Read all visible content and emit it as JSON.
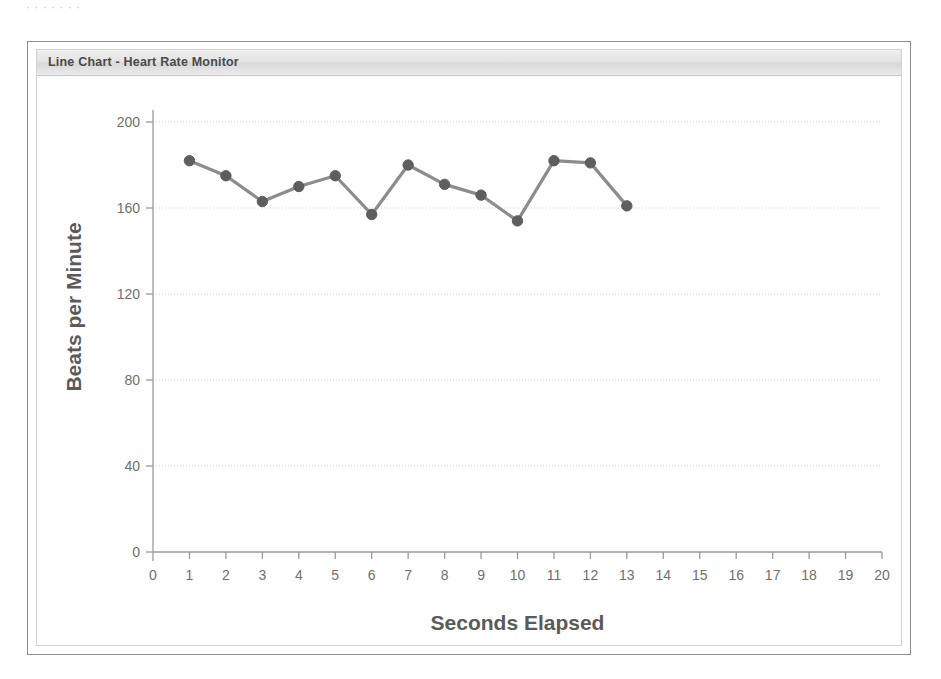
{
  "top_sliver": {
    "text": "· · · · · · ·"
  },
  "panel": {
    "title": "Line Chart - Heart Rate Monitor"
  },
  "colors": {
    "panel_border": "#8b8b8b",
    "inner_border": "#d2d2d2",
    "header_top": "#efefef",
    "header_bottom": "#d8d8d8",
    "title_text": "#4a4a4a",
    "axis": "#9a9a9a",
    "grid": "#cfcfcf",
    "line": "#8c8c8c",
    "marker": "#5e5e5e",
    "axis_title": "#5a5a5a",
    "tick_label": "#6f6f6f",
    "plot_background": "#ffffff"
  },
  "chart_data": {
    "type": "line",
    "title": "Line Chart - Heart Rate Monitor",
    "xlabel": "Seconds Elapsed",
    "ylabel": "Beats per Minute",
    "xlim": [
      0,
      20
    ],
    "ylim": [
      0,
      200
    ],
    "xticks": [
      0,
      1,
      2,
      3,
      4,
      5,
      6,
      7,
      8,
      9,
      10,
      11,
      12,
      13,
      14,
      15,
      16,
      17,
      18,
      19,
      20
    ],
    "yticks": [
      0,
      40,
      80,
      120,
      160,
      200
    ],
    "grid": true,
    "grid_axis": "y",
    "legend": false,
    "legend_position": "none",
    "marker": "circle",
    "x": [
      1,
      2,
      3,
      4,
      5,
      6,
      7,
      8,
      9,
      10,
      11,
      12,
      13
    ],
    "values": [
      182,
      175,
      163,
      170,
      175,
      157,
      180,
      171,
      166,
      154,
      182,
      181,
      161
    ],
    "series": [
      {
        "name": "Heart Rate",
        "values": [
          182,
          175,
          163,
          170,
          175,
          157,
          180,
          171,
          166,
          154,
          182,
          181,
          161
        ]
      }
    ]
  }
}
